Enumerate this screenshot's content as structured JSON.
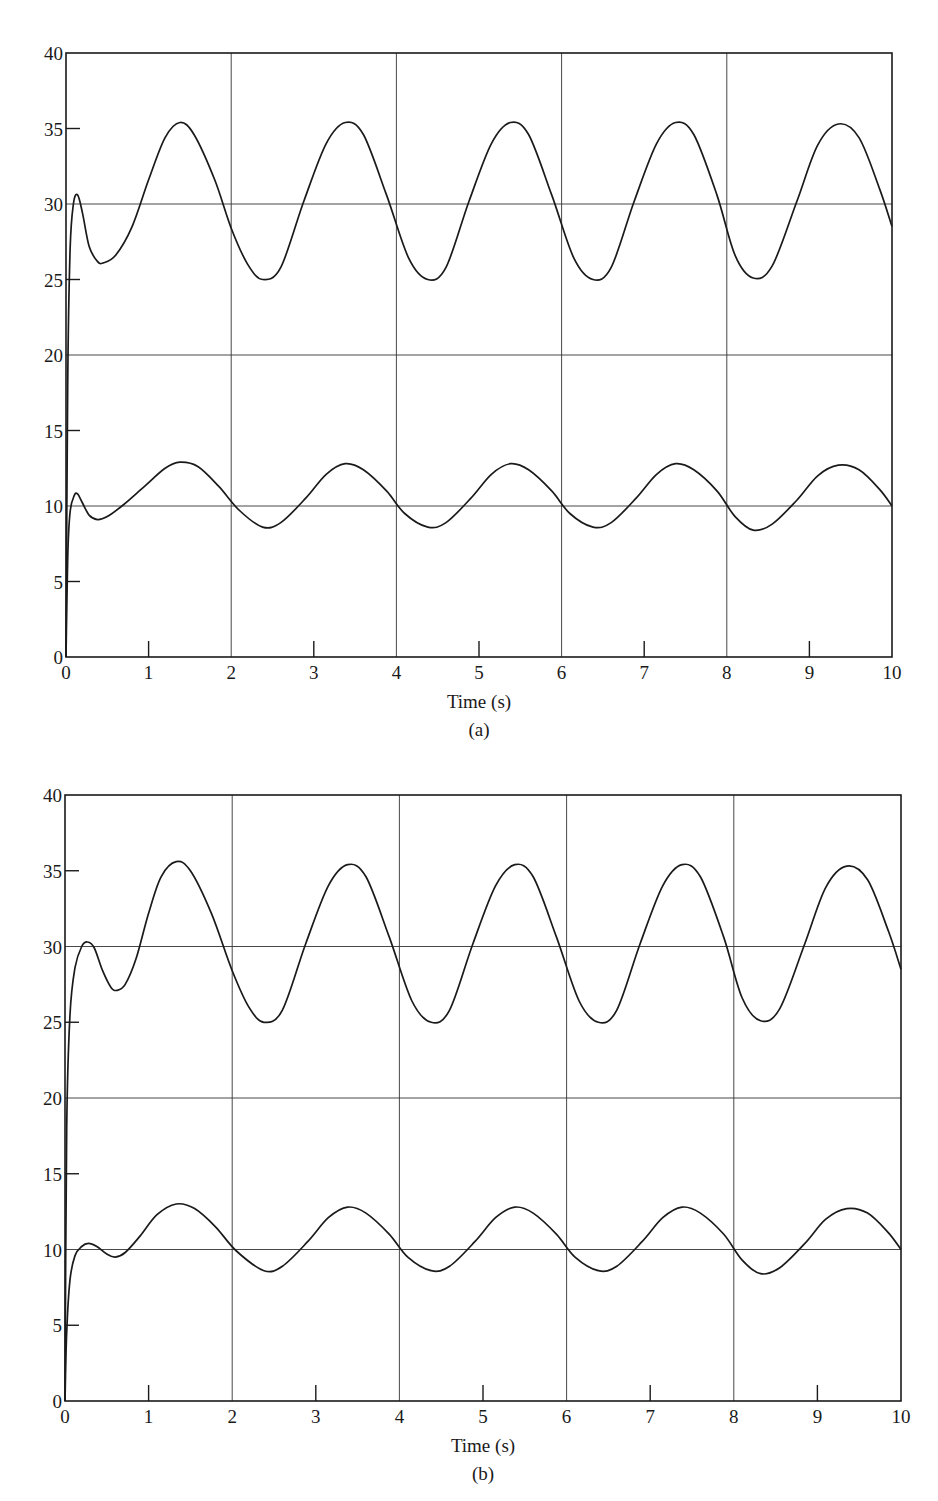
{
  "figure": {
    "panels": [
      "(a)",
      "(b)"
    ]
  },
  "chart_data": [
    {
      "type": "line",
      "caption": "(a)",
      "title": "",
      "xlabel": "Time (s)",
      "ylabel": "",
      "xlim": [
        0,
        10
      ],
      "ylim": [
        0,
        40
      ],
      "x_ticks": [
        0,
        1,
        2,
        3,
        4,
        5,
        6,
        7,
        8,
        9,
        10
      ],
      "y_ticks": [
        0,
        5,
        10,
        15,
        20,
        25,
        30,
        35,
        40
      ],
      "x_gridlines": [
        2,
        4,
        6,
        8
      ],
      "y_gridlines": [
        10,
        20,
        30
      ],
      "grid": true,
      "legend": "none",
      "series": [
        {
          "name": "upper",
          "points": [
            [
              0,
              0
            ],
            [
              0.02,
              18
            ],
            [
              0.05,
              27
            ],
            [
              0.09,
              30
            ],
            [
              0.14,
              30.6
            ],
            [
              0.2,
              29.4
            ],
            [
              0.28,
              27.2
            ],
            [
              0.38,
              26.2
            ],
            [
              0.45,
              26.1
            ],
            [
              0.6,
              26.6
            ],
            [
              0.8,
              28.5
            ],
            [
              1.0,
              31.6
            ],
            [
              1.2,
              34.4
            ],
            [
              1.38,
              35.4
            ],
            [
              1.55,
              34.6
            ],
            [
              1.8,
              31.6
            ],
            [
              2.0,
              28.4
            ],
            [
              2.2,
              26.0
            ],
            [
              2.38,
              25.0
            ],
            [
              2.6,
              25.8
            ],
            [
              2.88,
              30.2
            ],
            [
              3.15,
              34.0
            ],
            [
              3.38,
              35.4
            ],
            [
              3.6,
              34.6
            ],
            [
              3.88,
              30.6
            ],
            [
              4.15,
              26.4
            ],
            [
              4.38,
              25.0
            ],
            [
              4.6,
              25.8
            ],
            [
              4.88,
              30.2
            ],
            [
              5.15,
              34.0
            ],
            [
              5.38,
              35.4
            ],
            [
              5.6,
              34.6
            ],
            [
              5.88,
              30.6
            ],
            [
              6.15,
              26.4
            ],
            [
              6.38,
              25.0
            ],
            [
              6.6,
              25.8
            ],
            [
              6.88,
              30.2
            ],
            [
              7.15,
              34.0
            ],
            [
              7.38,
              35.4
            ],
            [
              7.6,
              34.6
            ],
            [
              7.88,
              30.6
            ],
            [
              8.1,
              26.6
            ],
            [
              8.32,
              25.1
            ],
            [
              8.55,
              25.9
            ],
            [
              8.85,
              30.2
            ],
            [
              9.1,
              33.9
            ],
            [
              9.35,
              35.3
            ],
            [
              9.6,
              34.4
            ],
            [
              9.85,
              31.0
            ],
            [
              10.0,
              28.5
            ]
          ]
        },
        {
          "name": "lower",
          "points": [
            [
              0,
              0
            ],
            [
              0.02,
              6.5
            ],
            [
              0.05,
              9.6
            ],
            [
              0.1,
              10.7
            ],
            [
              0.14,
              10.8
            ],
            [
              0.2,
              10.2
            ],
            [
              0.28,
              9.4
            ],
            [
              0.38,
              9.1
            ],
            [
              0.5,
              9.3
            ],
            [
              0.7,
              10.1
            ],
            [
              0.95,
              11.3
            ],
            [
              1.2,
              12.5
            ],
            [
              1.38,
              12.9
            ],
            [
              1.6,
              12.6
            ],
            [
              1.85,
              11.3
            ],
            [
              2.1,
              9.7
            ],
            [
              2.38,
              8.6
            ],
            [
              2.6,
              8.9
            ],
            [
              2.9,
              10.5
            ],
            [
              3.15,
              12.1
            ],
            [
              3.38,
              12.8
            ],
            [
              3.6,
              12.4
            ],
            [
              3.88,
              11.0
            ],
            [
              4.1,
              9.5
            ],
            [
              4.38,
              8.6
            ],
            [
              4.6,
              8.9
            ],
            [
              4.9,
              10.5
            ],
            [
              5.15,
              12.1
            ],
            [
              5.38,
              12.8
            ],
            [
              5.6,
              12.4
            ],
            [
              5.88,
              11.0
            ],
            [
              6.1,
              9.5
            ],
            [
              6.38,
              8.6
            ],
            [
              6.6,
              8.9
            ],
            [
              6.9,
              10.5
            ],
            [
              7.15,
              12.1
            ],
            [
              7.38,
              12.8
            ],
            [
              7.6,
              12.4
            ],
            [
              7.88,
              11.0
            ],
            [
              8.1,
              9.3
            ],
            [
              8.32,
              8.4
            ],
            [
              8.55,
              8.8
            ],
            [
              8.85,
              10.4
            ],
            [
              9.1,
              12.0
            ],
            [
              9.35,
              12.7
            ],
            [
              9.6,
              12.4
            ],
            [
              9.85,
              11.1
            ],
            [
              10.0,
              10.0
            ]
          ]
        }
      ]
    },
    {
      "type": "line",
      "caption": "(b)",
      "title": "",
      "xlabel": "Time (s)",
      "ylabel": "",
      "xlim": [
        0,
        10
      ],
      "ylim": [
        0,
        40
      ],
      "x_ticks": [
        0,
        1,
        2,
        3,
        4,
        5,
        6,
        7,
        8,
        9,
        10
      ],
      "y_ticks": [
        0,
        5,
        10,
        15,
        20,
        25,
        30,
        35,
        40
      ],
      "x_gridlines": [
        2,
        4,
        6,
        8
      ],
      "y_gridlines": [
        10,
        20,
        30
      ],
      "grid": true,
      "legend": "none",
      "series": [
        {
          "name": "upper",
          "points": [
            [
              0,
              0
            ],
            [
              0.02,
              18
            ],
            [
              0.06,
              25.5
            ],
            [
              0.12,
              28.6
            ],
            [
              0.2,
              30.0
            ],
            [
              0.27,
              30.3
            ],
            [
              0.35,
              29.9
            ],
            [
              0.45,
              28.4
            ],
            [
              0.55,
              27.3
            ],
            [
              0.62,
              27.1
            ],
            [
              0.72,
              27.5
            ],
            [
              0.85,
              29.2
            ],
            [
              1.0,
              32.2
            ],
            [
              1.15,
              34.6
            ],
            [
              1.33,
              35.6
            ],
            [
              1.5,
              35.0
            ],
            [
              1.75,
              32.2
            ],
            [
              2.0,
              28.4
            ],
            [
              2.2,
              26.0
            ],
            [
              2.38,
              25.0
            ],
            [
              2.6,
              25.8
            ],
            [
              2.88,
              30.2
            ],
            [
              3.15,
              34.0
            ],
            [
              3.38,
              35.4
            ],
            [
              3.6,
              34.6
            ],
            [
              3.88,
              30.6
            ],
            [
              4.15,
              26.4
            ],
            [
              4.38,
              25.0
            ],
            [
              4.6,
              25.8
            ],
            [
              4.88,
              30.2
            ],
            [
              5.15,
              34.0
            ],
            [
              5.38,
              35.4
            ],
            [
              5.6,
              34.6
            ],
            [
              5.88,
              30.6
            ],
            [
              6.15,
              26.4
            ],
            [
              6.38,
              25.0
            ],
            [
              6.6,
              25.8
            ],
            [
              6.88,
              30.2
            ],
            [
              7.15,
              34.0
            ],
            [
              7.38,
              35.4
            ],
            [
              7.6,
              34.6
            ],
            [
              7.88,
              30.6
            ],
            [
              8.1,
              26.6
            ],
            [
              8.32,
              25.1
            ],
            [
              8.55,
              25.9
            ],
            [
              8.85,
              30.2
            ],
            [
              9.1,
              33.9
            ],
            [
              9.35,
              35.3
            ],
            [
              9.6,
              34.4
            ],
            [
              9.85,
              31.0
            ],
            [
              10.0,
              28.5
            ]
          ]
        },
        {
          "name": "lower",
          "points": [
            [
              0,
              0
            ],
            [
              0.02,
              4.5
            ],
            [
              0.06,
              8.0
            ],
            [
              0.12,
              9.6
            ],
            [
              0.2,
              10.2
            ],
            [
              0.28,
              10.4
            ],
            [
              0.38,
              10.2
            ],
            [
              0.5,
              9.7
            ],
            [
              0.6,
              9.5
            ],
            [
              0.72,
              9.8
            ],
            [
              0.9,
              10.9
            ],
            [
              1.1,
              12.3
            ],
            [
              1.33,
              13.0
            ],
            [
              1.55,
              12.7
            ],
            [
              1.8,
              11.5
            ],
            [
              2.05,
              9.9
            ],
            [
              2.38,
              8.6
            ],
            [
              2.6,
              8.9
            ],
            [
              2.9,
              10.5
            ],
            [
              3.15,
              12.1
            ],
            [
              3.38,
              12.8
            ],
            [
              3.6,
              12.4
            ],
            [
              3.88,
              11.0
            ],
            [
              4.1,
              9.5
            ],
            [
              4.38,
              8.6
            ],
            [
              4.6,
              8.9
            ],
            [
              4.9,
              10.5
            ],
            [
              5.15,
              12.1
            ],
            [
              5.38,
              12.8
            ],
            [
              5.6,
              12.4
            ],
            [
              5.88,
              11.0
            ],
            [
              6.1,
              9.5
            ],
            [
              6.38,
              8.6
            ],
            [
              6.6,
              8.9
            ],
            [
              6.9,
              10.5
            ],
            [
              7.15,
              12.1
            ],
            [
              7.38,
              12.8
            ],
            [
              7.6,
              12.4
            ],
            [
              7.88,
              11.0
            ],
            [
              8.1,
              9.3
            ],
            [
              8.32,
              8.4
            ],
            [
              8.55,
              8.8
            ],
            [
              8.85,
              10.4
            ],
            [
              9.1,
              12.0
            ],
            [
              9.35,
              12.7
            ],
            [
              9.6,
              12.4
            ],
            [
              9.85,
              11.1
            ],
            [
              10.0,
              10.0
            ]
          ]
        }
      ]
    }
  ]
}
